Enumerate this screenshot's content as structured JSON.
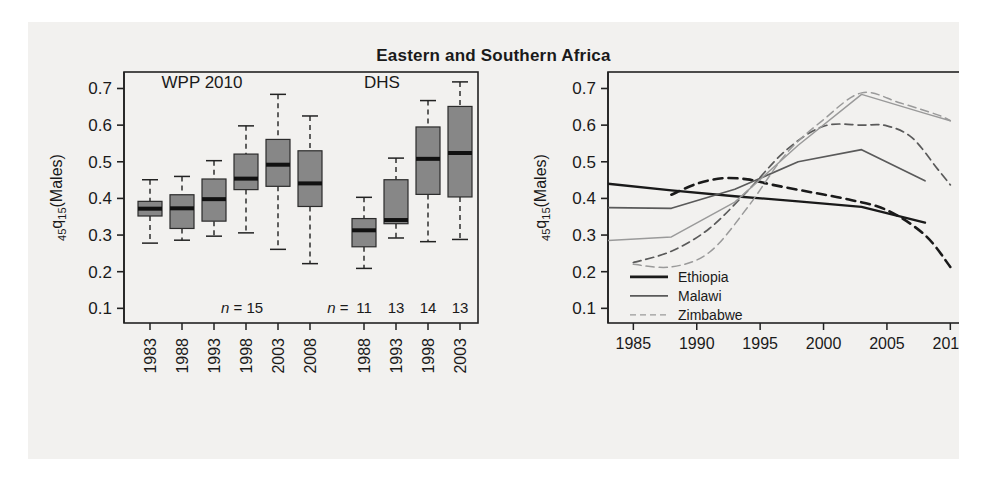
{
  "figure": {
    "title": "Eastern and Southern Africa",
    "background": "#f2f1ef",
    "frame_color": "#222222"
  },
  "chart_data": [
    {
      "type": "box",
      "panel": "left",
      "title": "",
      "xlabel": "",
      "ylabel": "45q15(Males)",
      "ylabel_main": "q",
      "ylabel_pre": "45",
      "ylabel_sub": "15",
      "ylabel_post": "(Males)",
      "ylim": [
        0.06,
        0.745
      ],
      "yticks": [
        0.1,
        0.2,
        0.3,
        0.4,
        0.5,
        0.6,
        0.7
      ],
      "ytick_labels": [
        "0.1",
        "0.2",
        "0.3",
        "0.4",
        "0.5",
        "0.6",
        "0.7"
      ],
      "grid": false,
      "legend": "none",
      "group_labels": [
        "WPP 2010",
        "DHS"
      ],
      "categories": [
        "1983",
        "1988",
        "1993",
        "1998",
        "2003",
        "2008",
        "1988",
        "1993",
        "1998",
        "2003"
      ],
      "groups": [
        "WPP 2010",
        "WPP 2010",
        "WPP 2010",
        "WPP 2010",
        "WPP 2010",
        "WPP 2010",
        "DHS",
        "DHS",
        "DHS",
        "DHS"
      ],
      "n_label_wpp": "n = 15",
      "n_label_dhs_prefix": "n =",
      "n_values_dhs": [
        "11",
        "13",
        "14",
        "13"
      ],
      "boxes": [
        {
          "category": "1983",
          "group": "WPP 2010",
          "lower_whisker": 0.278,
          "q1": 0.352,
          "median": 0.372,
          "q3": 0.392,
          "upper_whisker": 0.451
        },
        {
          "category": "1988",
          "group": "WPP 2010",
          "lower_whisker": 0.286,
          "q1": 0.318,
          "median": 0.373,
          "q3": 0.41,
          "upper_whisker": 0.46
        },
        {
          "category": "1993",
          "group": "WPP 2010",
          "lower_whisker": 0.297,
          "q1": 0.338,
          "median": 0.398,
          "q3": 0.453,
          "upper_whisker": 0.503
        },
        {
          "category": "1998",
          "group": "WPP 2010",
          "lower_whisker": 0.306,
          "q1": 0.424,
          "median": 0.454,
          "q3": 0.521,
          "upper_whisker": 0.598
        },
        {
          "category": "2003",
          "group": "WPP 2010",
          "lower_whisker": 0.261,
          "q1": 0.433,
          "median": 0.492,
          "q3": 0.561,
          "upper_whisker": 0.684
        },
        {
          "category": "2008",
          "group": "WPP 2010",
          "lower_whisker": 0.222,
          "q1": 0.378,
          "median": 0.441,
          "q3": 0.53,
          "upper_whisker": 0.625
        },
        {
          "category": "1988",
          "group": "DHS",
          "lower_whisker": 0.209,
          "q1": 0.268,
          "median": 0.313,
          "q3": 0.345,
          "upper_whisker": 0.403
        },
        {
          "category": "1993",
          "group": "DHS",
          "lower_whisker": 0.292,
          "q1": 0.331,
          "median": 0.341,
          "q3": 0.451,
          "upper_whisker": 0.51
        },
        {
          "category": "1998",
          "group": "DHS",
          "lower_whisker": 0.282,
          "q1": 0.411,
          "median": 0.508,
          "q3": 0.595,
          "upper_whisker": 0.667
        },
        {
          "category": "2003",
          "group": "DHS",
          "lower_whisker": 0.288,
          "q1": 0.404,
          "median": 0.524,
          "q3": 0.651,
          "upper_whisker": 0.718
        }
      ],
      "box_fill": "#878787",
      "box_stroke": "#2b2b2b"
    },
    {
      "type": "line",
      "panel": "right",
      "title": "",
      "xlabel": "",
      "ylabel": "45q15(Males)",
      "ylabel_main": "q",
      "ylabel_pre": "45",
      "ylabel_sub": "15",
      "ylabel_post": "(Males)",
      "xlim": [
        1983,
        2011
      ],
      "ylim": [
        0.06,
        0.745
      ],
      "xticks": [
        1985,
        1990,
        1995,
        2000,
        2005,
        2010
      ],
      "xtick_labels": [
        "1985",
        "1990",
        "1995",
        "2000",
        "2005",
        "2010"
      ],
      "yticks": [
        0.1,
        0.2,
        0.3,
        0.4,
        0.5,
        0.6,
        0.7
      ],
      "ytick_labels": [
        "0.1",
        "0.2",
        "0.3",
        "0.4",
        "0.5",
        "0.6",
        "0.7"
      ],
      "grid": false,
      "legend_position": "bottom-left",
      "legend": [
        {
          "label": "Ethiopia",
          "color": "#1a1a1a",
          "width": 2.6
        },
        {
          "label": "Malawi",
          "color": "#5a5a5a",
          "width": 1.6
        },
        {
          "label": "Zimbabwe",
          "color": "#9a9a9a",
          "width": 1.4
        }
      ],
      "series": [
        {
          "name": "Ethiopia",
          "style": "solid",
          "color": "#1a1a1a",
          "x": [
            1983,
            1988,
            1993,
            1998,
            2003,
            2008
          ],
          "values": [
            0.44,
            0.422,
            0.406,
            0.392,
            0.377,
            0.334
          ]
        },
        {
          "name": "Ethiopia",
          "style": "dashed",
          "color": "#1a1a1a",
          "x": [
            1988,
            1990,
            1992,
            1994,
            1996,
            1999,
            2002,
            2005,
            2008,
            2010
          ],
          "values": [
            0.41,
            0.44,
            0.455,
            0.452,
            0.437,
            0.417,
            0.397,
            0.368,
            0.3,
            0.213
          ]
        },
        {
          "name": "Malawi",
          "style": "solid",
          "color": "#5a5a5a",
          "x": [
            1983,
            1988,
            1993,
            1998,
            2003,
            2008
          ],
          "values": [
            0.375,
            0.373,
            0.425,
            0.5,
            0.533,
            0.448
          ]
        },
        {
          "name": "Malawi",
          "style": "dashed",
          "color": "#5a5a5a",
          "x": [
            1985,
            1988,
            1991,
            1994,
            1997,
            2000,
            2003,
            2005,
            2007,
            2009,
            2010
          ],
          "values": [
            0.225,
            0.256,
            0.318,
            0.42,
            0.53,
            0.597,
            0.6,
            0.598,
            0.565,
            0.48,
            0.437
          ]
        },
        {
          "name": "Zimbabwe",
          "style": "solid",
          "color": "#9a9a9a",
          "x": [
            1983,
            1988,
            1993,
            1998,
            2003,
            2008,
            2010
          ],
          "values": [
            0.285,
            0.295,
            0.39,
            0.545,
            0.684,
            0.632,
            0.612
          ]
        },
        {
          "name": "Zimbabwe",
          "style": "dashed",
          "color": "#9a9a9a",
          "x": [
            1985,
            1988,
            1991,
            1994,
            1997,
            2000,
            2003,
            2006,
            2009,
            2010
          ],
          "values": [
            0.22,
            0.213,
            0.253,
            0.375,
            0.52,
            0.615,
            0.688,
            0.661,
            0.628,
            0.612
          ]
        }
      ]
    }
  ]
}
